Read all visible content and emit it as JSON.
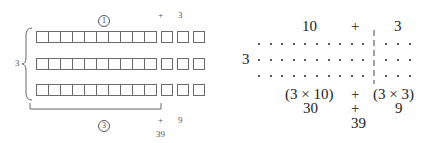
{
  "left_diagram": {
    "top_circled_label": "1",
    "top_plus": "+",
    "top_right_value": "3",
    "row_label": "3",
    "rows": 3,
    "left_boxes_per_row": 10,
    "right_boxes_per_row": 3,
    "bottom_circled_label": "3",
    "bottom_plus": "+",
    "bottom_right_value": "9",
    "total": "39"
  },
  "right_diagram": {
    "top_left_value": "10",
    "top_plus": "+",
    "top_right_value": "3",
    "row_label": "3",
    "rows": 3,
    "left_dots_per_row": 10,
    "right_dots_per_row": 3,
    "product_left": "(3 × 10)",
    "product_plus": "+",
    "product_right": "(3 × 3)",
    "partial_left": "30",
    "partial_plus": "+",
    "partial_right": "9",
    "total": "39"
  }
}
